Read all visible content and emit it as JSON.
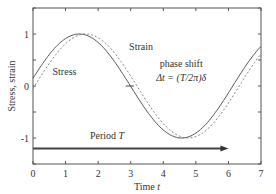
{
  "chart_data": {
    "type": "line",
    "title": "",
    "xlabel": "Time t",
    "ylabel": "Stress, strain",
    "xlim": [
      0,
      7
    ],
    "ylim": [
      -1.5,
      1.5
    ],
    "x_ticks": [
      "0",
      "1",
      "2",
      "3",
      "4",
      "5",
      "6",
      "7"
    ],
    "y_ticks": [
      "-1",
      "0",
      "1"
    ],
    "grid": false,
    "series": [
      {
        "name": "Stress",
        "style": "solid",
        "function": "sin(t + 0.15)",
        "peak_t": 1.42,
        "trough_t": 4.56,
        "value_at_0": 0.15
      },
      {
        "name": "Strain",
        "style": "dashed",
        "function": "sin(t - 0.05)",
        "peak_t": 1.62,
        "trough_t": 4.76,
        "value_at_0": -0.05
      }
    ],
    "annotations": [
      {
        "text": "Stress",
        "x": 0.9,
        "y": 0.25
      },
      {
        "text": "Strain",
        "x": 3.0,
        "y": 0.68
      },
      {
        "text": "phase shift",
        "x": 4.4,
        "y": 0.35
      },
      {
        "text": "Δt = (T/2π)δ",
        "x": 4.4,
        "y": 0.1
      },
      {
        "text": "Period T",
        "x": 1.8,
        "y": -1.05
      }
    ],
    "arrow": {
      "label": "Period T",
      "from_x": 0,
      "to_x": 6.0,
      "y": -1.2
    }
  },
  "labels": {
    "xlabel_prefix": "Time ",
    "xlabel_var": "t",
    "ylabel": "Stress, strain",
    "stress": "Stress",
    "strain": "Strain",
    "phase_shift": "phase shift",
    "delta_t": "Δt = (T/2π)δ",
    "period_prefix": "Period ",
    "period_var": "T"
  }
}
